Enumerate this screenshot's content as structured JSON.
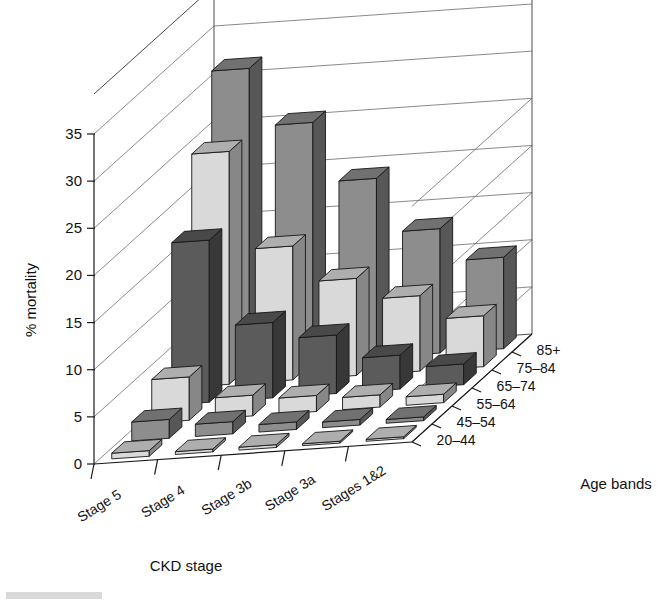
{
  "chart_data": {
    "type": "bar",
    "render": "3d-grouped-bar",
    "title": "",
    "xlabel": "CKD stage",
    "ylabel": "% mortality",
    "zlabel": "Age bands",
    "ylim": [
      0,
      35
    ],
    "y_ticks": [
      0,
      5,
      10,
      15,
      20,
      25,
      30,
      35
    ],
    "y_tick_labels": [
      "0",
      "5",
      "10",
      "15",
      "20",
      "25",
      "30",
      "35"
    ],
    "grid": true,
    "legend": "none",
    "categories": [
      "Stage 5",
      "Stage 4",
      "Stage 3b",
      "Stage 3a",
      "Stages 1&2"
    ],
    "depth_categories": [
      "20–44",
      "45–54",
      "55–64",
      "65–74",
      "75–84",
      "85+"
    ],
    "series": [
      {
        "name": "20–44",
        "values": [
          0.6,
          0.3,
          0.3,
          0.2,
          0.2
        ]
      },
      {
        "name": "45–54",
        "values": [
          2.0,
          1.3,
          0.8,
          0.6,
          0.4
        ]
      },
      {
        "name": "55–64",
        "values": [
          4.6,
          2.2,
          1.7,
          1.3,
          0.9
        ]
      },
      {
        "name": "65–74",
        "values": [
          17.2,
          8.0,
          6.2,
          3.6,
          2.2
        ]
      },
      {
        "name": "75–84",
        "values": [
          24.7,
          14.2,
          10.3,
          8.0,
          5.4
        ]
      },
      {
        "name": "85+",
        "values": [
          31.6,
          25.4,
          19.0,
          13.2,
          9.7
        ]
      }
    ],
    "series_fill_hex": [
      "#d9d9d9",
      "#8d8d8d",
      "#d9d9d9",
      "#5b5b5b",
      "#d9d9d9",
      "#8d8d8d"
    ]
  },
  "axes": {
    "y_title": "% mortality",
    "x_title": "CKD stage",
    "z_title": "Age bands"
  }
}
